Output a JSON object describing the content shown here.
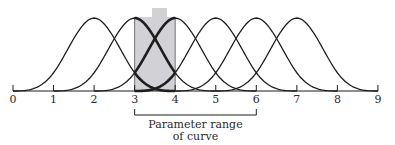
{
  "diagram": {
    "type": "b-spline-basis-functions",
    "axis": {
      "min": 0,
      "max": 9,
      "tick_labels": [
        "0",
        "1",
        "2",
        "3",
        "4",
        "5",
        "6",
        "7",
        "8",
        "9"
      ]
    },
    "curves": [
      {
        "start": 0,
        "peak": 2,
        "end": 4
      },
      {
        "start": 1,
        "peak": 3,
        "end": 5
      },
      {
        "start": 2,
        "peak": 4,
        "end": 6
      },
      {
        "start": 3,
        "peak": 5,
        "end": 7
      },
      {
        "start": 4,
        "peak": 6,
        "end": 8
      },
      {
        "start": 5,
        "peak": 7,
        "end": 9
      }
    ],
    "highlighted_interval": {
      "from": 3,
      "to": 4
    },
    "shade_color": "#d2d2d6",
    "line_color": "#1e1e1e",
    "bracket": {
      "from": 3,
      "to": 6,
      "label_line1": "Parameter range",
      "label_line2": "of curve"
    }
  }
}
